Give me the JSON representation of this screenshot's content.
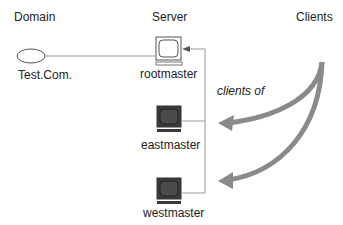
{
  "headers": {
    "domain": "Domain",
    "server": "Server",
    "clients": "Clients"
  },
  "domain_node": {
    "label": "Test.Com.",
    "shape": "ellipse"
  },
  "servers": [
    {
      "name": "rootmaster",
      "icon": "monitor-icon",
      "screen": "light",
      "role": "root"
    },
    {
      "name": "eastmaster",
      "icon": "monitor-icon",
      "screen": "dark",
      "role": "subordinate"
    },
    {
      "name": "westmaster",
      "icon": "monitor-icon",
      "screen": "dark",
      "role": "subordinate"
    }
  ],
  "relationship_label": "clients of",
  "colors": {
    "line": "#888888",
    "arrow": "#8a8a8a",
    "monitor_dark": "#3a3a3a",
    "monitor_light": "#ffffff",
    "text": "#222222"
  }
}
